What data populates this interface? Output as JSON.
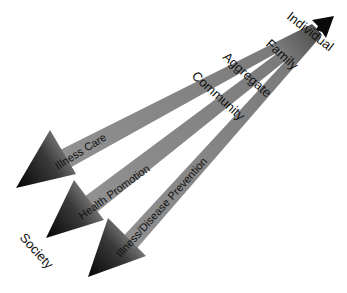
{
  "diagram": {
    "type": "converging-arrows",
    "origin_label": "Individual",
    "level_labels": [
      "Family",
      "Aggregate",
      "Community"
    ],
    "end_label": "Society",
    "arrows": [
      {
        "label": "Illness Care"
      },
      {
        "label": "Health Promotion"
      },
      {
        "label": "Illness/Disease Prevention"
      }
    ],
    "colors": {
      "shaft": "#8c8c8c",
      "head_dark": "#0a0a0a",
      "text": "#111111"
    }
  }
}
